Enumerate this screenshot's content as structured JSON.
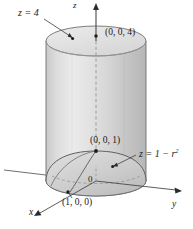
{
  "figure": {
    "background_color": "#ffffff",
    "labels": {
      "plane_z4": "z = 4",
      "point_top": "(0, 0, 4)",
      "axis_z": "z",
      "point_apex": "(0, 0, 1)",
      "paraboloid_eq_lead": "z = 1 − r",
      "paraboloid_eq_exp": "2",
      "origin": "0",
      "point_x": "(1, 0, 0)",
      "axis_x": "x",
      "axis_y": "y"
    },
    "colors": {
      "cylinder_body_light": "#e8e8e8",
      "cylinder_body_mid": "#d2d2d2",
      "cylinder_body_shadow": "#bdbdbd",
      "cylinder_top_cap": "#e0e0e0",
      "dome_light": "#d8d8d8",
      "dome_mid": "#c4c4c4",
      "outline": "#6f6f6f",
      "axis": "#4a4a4a",
      "text": "#1a1a1a"
    },
    "geometry": {
      "cylinder_radius_units": 1,
      "cylinder_top_z": 4,
      "paraboloid_apex_z": 1,
      "surfaces": [
        "cylinder",
        "paraboloid z = 1 - r^2",
        "plane z = 4"
      ]
    }
  }
}
